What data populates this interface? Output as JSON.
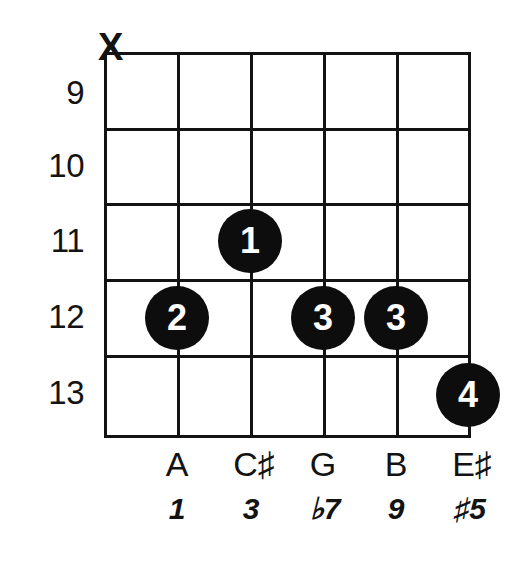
{
  "diagram": {
    "type": "guitar-chord-diagram",
    "orientation": "vertical",
    "string_count": 6,
    "fret_count": 5,
    "ink_color": "#131313",
    "dot_fill": "#0d0d0d",
    "dot_text_color": "#ffffff",
    "background": "#ffffff"
  },
  "fret_numbers": [
    {
      "label": "9",
      "y": 93
    },
    {
      "label": "10",
      "y": 166
    },
    {
      "label": "11",
      "y": 241
    },
    {
      "label": "12",
      "y": 317
    },
    {
      "label": "13",
      "y": 393
    }
  ],
  "string_markers": [
    {
      "string": 1,
      "symbol": "X",
      "meaning": "muted",
      "x": 98,
      "y": 28
    }
  ],
  "finger_dots": [
    {
      "finger": "1",
      "string": 3,
      "fret": 11,
      "x": 250,
      "y": 241
    },
    {
      "finger": "2",
      "string": 2,
      "fret": 12,
      "x": 177,
      "y": 318
    },
    {
      "finger": "3",
      "string": 4,
      "fret": 12,
      "x": 323,
      "y": 318
    },
    {
      "finger": "3",
      "string": 5,
      "fret": 12,
      "x": 396,
      "y": 318
    },
    {
      "finger": "4",
      "string": 6,
      "fret": 13,
      "x": 468,
      "y": 395
    }
  ],
  "note_labels": [
    {
      "text": "A",
      "x": 177
    },
    {
      "text": "C♯",
      "x": 254
    },
    {
      "text": "G",
      "x": 323
    },
    {
      "text": "B",
      "x": 396
    },
    {
      "text": "E♯",
      "x": 472
    }
  ],
  "interval_labels": [
    {
      "text": "1",
      "x": 177
    },
    {
      "text": "3",
      "x": 251
    },
    {
      "text": "♭7",
      "x": 325
    },
    {
      "text": "9",
      "x": 396
    },
    {
      "text": "♯5",
      "x": 470
    }
  ],
  "geometry": {
    "grid_left": 104,
    "grid_right": 468,
    "grid_top": 52,
    "grid_bottom": 435,
    "fret_line_y": [
      52,
      128,
      203,
      279,
      355,
      435
    ],
    "string_line_x": [
      104,
      177,
      250,
      323,
      396,
      468
    ]
  }
}
